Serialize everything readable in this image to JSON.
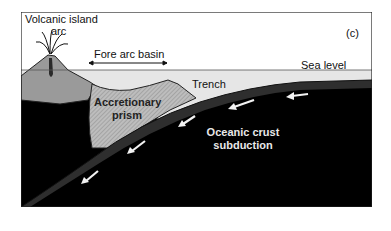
{
  "figure": {
    "panel_label": "(c)",
    "labels": {
      "volcanic_island_line1": "Volcanic island",
      "volcanic_island_line2": "arc",
      "fore_arc_basin": "Fore arc basin",
      "trench": "Trench",
      "sea_level": "Sea level",
      "accretionary_prism_line1": "Accretionary",
      "accretionary_prism_line2": "prism",
      "oceanic_crust_line1": "Oceanic crust",
      "oceanic_crust_line2": "subduction"
    },
    "colors": {
      "sky": "#ffffff",
      "sea": "#e6e6e6",
      "volcano": "#9a9a9a",
      "prism": "#b8b8b8",
      "mantle": "#000000",
      "slab": "#2a2a2a",
      "arrow": "#f2f2f2",
      "frame": "#222222"
    },
    "subduction_arrows": 5
  }
}
